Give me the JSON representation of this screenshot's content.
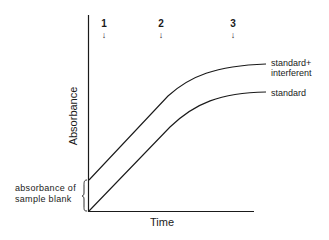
{
  "diagram": {
    "y_axis_label": "Absorbance",
    "x_axis_label": "Time",
    "markers": [
      {
        "label": "1",
        "arrow": "↓"
      },
      {
        "label": "2",
        "arrow": "↓"
      },
      {
        "label": "3",
        "arrow": "↓"
      }
    ],
    "curves": [
      {
        "label_line1": "standard+",
        "label_line2": "interferent"
      },
      {
        "label": "standard"
      }
    ],
    "blank_label_line1": "absorbance of",
    "blank_label_line2": "sample blank"
  },
  "colors": {
    "line": "#1a1a1a",
    "background": "#ffffff"
  }
}
